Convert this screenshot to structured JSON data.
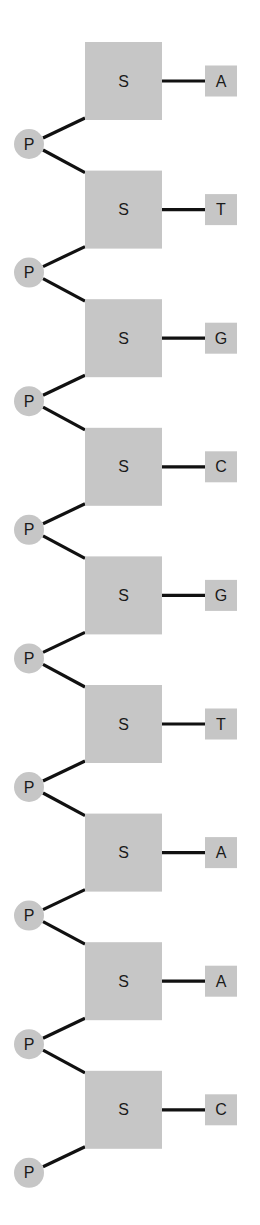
{
  "diagram": {
    "sugar_label": "S",
    "phosphate_label": "P",
    "nucleotides": [
      {
        "sugar": "S",
        "base": "A"
      },
      {
        "sugar": "S",
        "base": "T"
      },
      {
        "sugar": "S",
        "base": "G"
      },
      {
        "sugar": "S",
        "base": "C"
      },
      {
        "sugar": "S",
        "base": "G"
      },
      {
        "sugar": "S",
        "base": "T"
      },
      {
        "sugar": "S",
        "base": "A"
      },
      {
        "sugar": "S",
        "base": "A"
      },
      {
        "sugar": "S",
        "base": "C"
      }
    ],
    "phosphates": [
      "P",
      "P",
      "P",
      "P",
      "P",
      "P",
      "P",
      "P",
      "P"
    ],
    "colors": {
      "fill": "#c6c6c6",
      "bond": "#111111",
      "text": "#1a1a1a"
    }
  }
}
